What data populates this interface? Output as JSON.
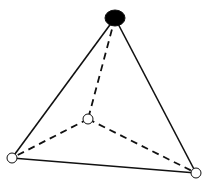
{
  "diagram": {
    "type": "tetrahedron",
    "colors": {
      "edge": "#111111",
      "apex_fill": "#000000",
      "vertex_fill": "#ffffff",
      "background": "#ffffff"
    },
    "vertices": [
      {
        "id": "apex",
        "x": 115,
        "y": 18,
        "rx": 10,
        "ry": 8,
        "filled": true
      },
      {
        "id": "back",
        "x": 88,
        "y": 119,
        "rx": 5,
        "ry": 5,
        "filled": false
      },
      {
        "id": "left",
        "x": 12,
        "y": 158,
        "rx": 5,
        "ry": 5,
        "filled": false
      },
      {
        "id": "right",
        "x": 196,
        "y": 173,
        "rx": 5,
        "ry": 5,
        "filled": false
      }
    ],
    "edges": [
      {
        "from": "apex",
        "to": "left",
        "style": "solid"
      },
      {
        "from": "apex",
        "to": "right",
        "style": "solid"
      },
      {
        "from": "left",
        "to": "right",
        "style": "solid"
      },
      {
        "from": "apex",
        "to": "back",
        "style": "dashed"
      },
      {
        "from": "back",
        "to": "left",
        "style": "dashed"
      },
      {
        "from": "back",
        "to": "right",
        "style": "dashed"
      }
    ]
  }
}
